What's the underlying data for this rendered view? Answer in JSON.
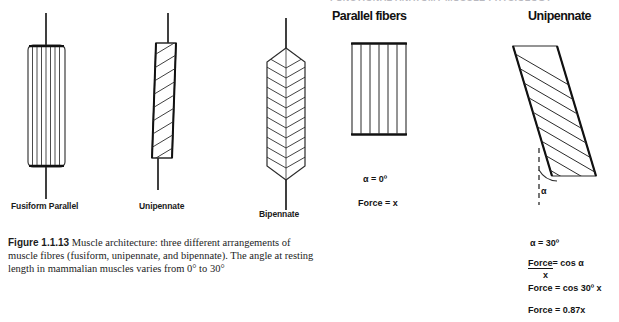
{
  "figure": {
    "clipped_top_text": "FUNCTIONAL ANATOMY  MUSCLE PHYSIOLOGY",
    "caption_label": "Figure 1.1.13",
    "caption_text": "Muscle architecture: three different arrangements of muscle fibres (fusiform, unipennate, and bipennate). The angle at resting length in mammalian muscles varies from 0° to 30°",
    "diagram_labels": {
      "fusiform": "Fusiform Parallel",
      "unipennate": "Unipennate",
      "bipennate": "Bipennate"
    }
  },
  "panels": {
    "parallel": {
      "heading": "Parallel fibers",
      "angle": "α  = 0º",
      "force": "Force = x",
      "fiber_count": 5
    },
    "unipennate": {
      "heading": "Unipennate",
      "angle_symbol": "α",
      "angle": "α  = 30º",
      "force_numerator": "Force",
      "force_denominator": "x",
      "force_equals_cos_alpha": "= cos α",
      "force_cos30": "Force = cos 30º  x",
      "force_value": "Force = 0.87x",
      "fiber_count": 11
    }
  },
  "colors": {
    "background": "#ffffff",
    "ink": "#1a1a1a",
    "outline": "#2b2b2b",
    "tendon": "#111111"
  }
}
